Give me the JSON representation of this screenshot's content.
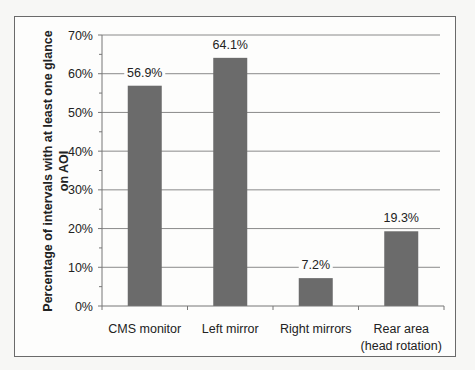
{
  "chart_data": {
    "type": "bar",
    "title": "",
    "xlabel": "",
    "ylabel": [
      "Percentage of intervals with at least one glance",
      "on AOI"
    ],
    "categories": [
      [
        "CMS monitor"
      ],
      [
        "Left mirror"
      ],
      [
        "Right mirrors"
      ],
      [
        "Rear area",
        "(head rotation)"
      ]
    ],
    "values": [
      56.9,
      64.1,
      7.2,
      19.3
    ],
    "value_labels": [
      "56.9%",
      "64.1%",
      "7.2%",
      "19.3%"
    ],
    "ylim": [
      0,
      70
    ],
    "yticks": [
      0,
      10,
      20,
      30,
      40,
      50,
      60,
      70
    ],
    "ytick_labels": [
      "0%",
      "10%",
      "20%",
      "30%",
      "40%",
      "50%",
      "60%",
      "70%"
    ],
    "grid": true,
    "legend": null,
    "colors": {
      "bar": "#6b6b6b",
      "grid": "#8a8a8a",
      "axis": "#777777"
    }
  }
}
